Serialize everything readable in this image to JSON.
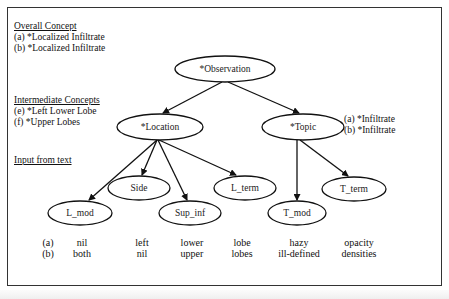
{
  "overall": {
    "heading": "Overall Concept",
    "a": "(a) *Localized Infiltrate",
    "b": "(b) *Localized Infiltrate"
  },
  "intermediate": {
    "heading": "Intermediate Concepts",
    "e": "(e)  *Left Lower Lobe",
    "f": "(f)  *Upper Lobes"
  },
  "input": {
    "heading": "Input from text"
  },
  "topic_annotations": {
    "a": "(a) *Infiltrate",
    "b": "(b) *Infiltrate"
  },
  "nodes": {
    "observation": "*Observation",
    "location": "*Location",
    "topic": "*Topic",
    "side": "Side",
    "l_term": "L_term",
    "l_mod": "L_mod",
    "sup_inf": "Sup_inf",
    "t_mod": "T_mod",
    "t_term": "T_term"
  },
  "rows": {
    "labels": [
      "(a)",
      "(b)"
    ],
    "l_mod": [
      "nil",
      "both"
    ],
    "side": [
      "left",
      "nil"
    ],
    "sup_inf": [
      "lower",
      "upper"
    ],
    "l_term": [
      "lobe",
      "lobes"
    ],
    "t_mod": [
      "hazy",
      "ill-defined"
    ],
    "t_term": [
      "opacity",
      "densities"
    ]
  }
}
